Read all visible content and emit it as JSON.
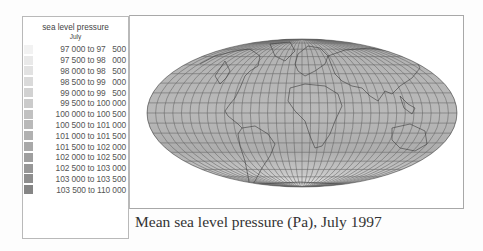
{
  "legend": {
    "title": "sea level pressure",
    "subtitle": "July",
    "items": [
      {
        "label": "97 000 to 97   500",
        "color": "#f2f2f2"
      },
      {
        "label": "97 500 to 98   000",
        "color": "#e9e9e9"
      },
      {
        "label": "98 000 to 98   500",
        "color": "#e2e2e2"
      },
      {
        "label": "98 500 to 99   000",
        "color": "#dadada"
      },
      {
        "label": "99 000 to 99   500",
        "color": "#d2d2d2"
      },
      {
        "label": "99 500 to 100 000",
        "color": "#cbcbcb"
      },
      {
        "label": "100 000 to 100 500",
        "color": "#c1c1c1"
      },
      {
        "label": "100 500 to 101 000",
        "color": "#b9b9b9"
      },
      {
        "label": "101 000 to 101 500",
        "color": "#b1b1b1"
      },
      {
        "label": "101 500 to 102 000",
        "color": "#a9a9a9"
      },
      {
        "label": "102 000 to 102 500",
        "color": "#9f9f9f"
      },
      {
        "label": "102 500 to 103 000",
        "color": "#979797"
      },
      {
        "label": "103 000 to 103 500",
        "color": "#8e8e8e"
      },
      {
        "label": "103 500 to 110 000",
        "color": "#858585"
      }
    ]
  },
  "map": {
    "projection": "Mollweide",
    "variable": "sea level pressure",
    "month": "July",
    "fill_color": "#b4b4b4",
    "graticule_color": "#6a6a6a",
    "coastline_color": "#333333"
  },
  "caption": "Mean sea level pressure (Pa), July 1997"
}
